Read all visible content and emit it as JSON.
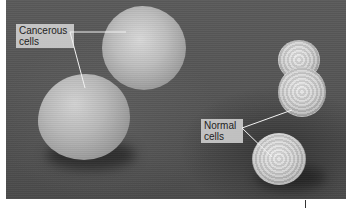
{
  "figure": {
    "type": "scanning-electron-micrograph",
    "colors": {
      "background": "#555555",
      "label_bg": "#dcdcdc",
      "label_text": "#1e1e1e",
      "leader_line": "#f0f0f0"
    },
    "labels": {
      "cancerous": {
        "line1": "Cancerous",
        "line2": "cells"
      },
      "normal": {
        "line1": "Normal",
        "line2": "cells"
      }
    },
    "cells": [
      {
        "kind": "cancerous",
        "position": "upper-center"
      },
      {
        "kind": "cancerous",
        "position": "lower-left"
      },
      {
        "kind": "normal",
        "position": "upper-right"
      },
      {
        "kind": "normal",
        "position": "right-middle"
      },
      {
        "kind": "normal",
        "position": "lower-right"
      }
    ]
  }
}
